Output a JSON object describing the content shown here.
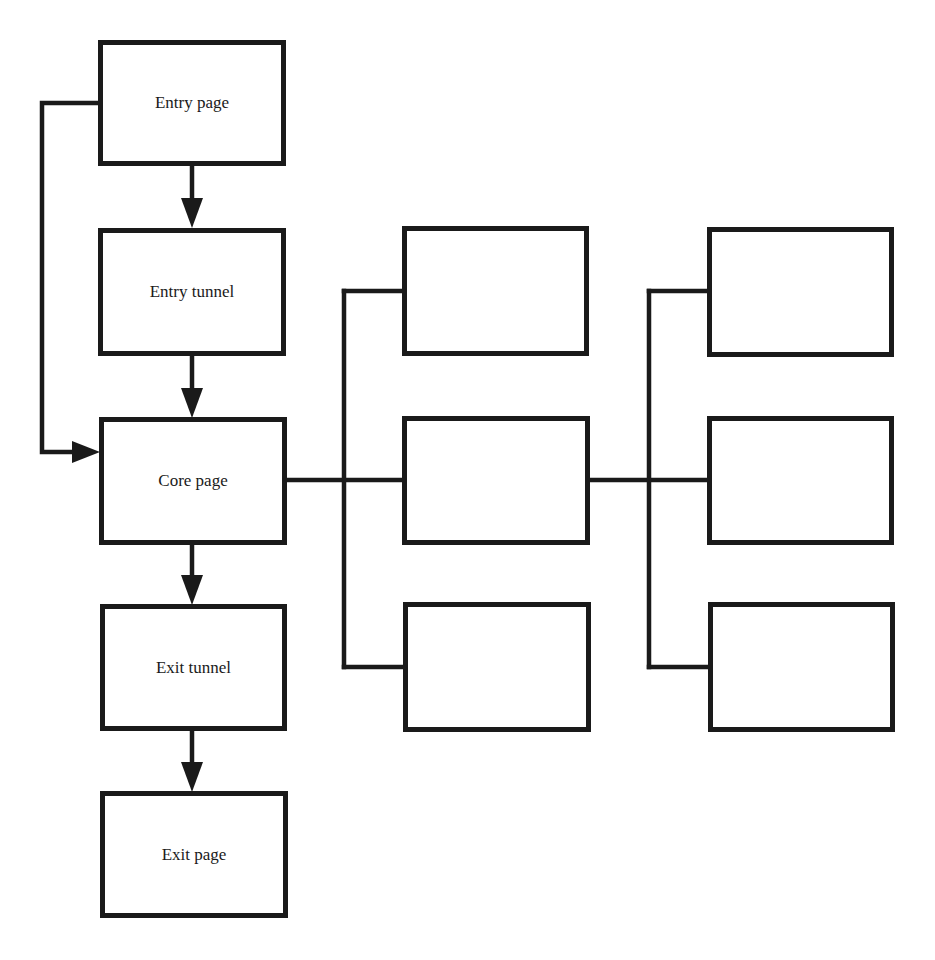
{
  "diagram": {
    "type": "flowchart",
    "colors": {
      "stroke": "#1a1a1a",
      "background": "#ffffff"
    },
    "main_flow": [
      {
        "id": "entry-page",
        "label": "Entry page"
      },
      {
        "id": "entry-tunnel",
        "label": "Entry tunnel"
      },
      {
        "id": "core-page",
        "label": "Core page"
      },
      {
        "id": "exit-tunnel",
        "label": "Exit tunnel"
      },
      {
        "id": "exit-page",
        "label": "Exit page"
      }
    ],
    "branch_column_1": [
      {
        "id": "branch1-top",
        "label": ""
      },
      {
        "id": "branch1-middle",
        "label": ""
      },
      {
        "id": "branch1-bottom",
        "label": ""
      }
    ],
    "branch_column_2": [
      {
        "id": "branch2-top",
        "label": ""
      },
      {
        "id": "branch2-middle",
        "label": ""
      },
      {
        "id": "branch2-bottom",
        "label": ""
      }
    ],
    "edges": [
      {
        "from": "entry-page",
        "to": "entry-tunnel",
        "arrow": true
      },
      {
        "from": "entry-tunnel",
        "to": "core-page",
        "arrow": true
      },
      {
        "from": "entry-page",
        "to": "core-page",
        "arrow": true,
        "route": "left-bypass"
      },
      {
        "from": "core-page",
        "to": "exit-tunnel",
        "arrow": true
      },
      {
        "from": "exit-tunnel",
        "to": "exit-page",
        "arrow": true
      },
      {
        "from": "core-page",
        "to": "branch_column_1",
        "arrow": false,
        "route": "bus"
      },
      {
        "from": "branch1-middle",
        "to": "branch_column_2",
        "arrow": false,
        "route": "bus"
      }
    ]
  }
}
